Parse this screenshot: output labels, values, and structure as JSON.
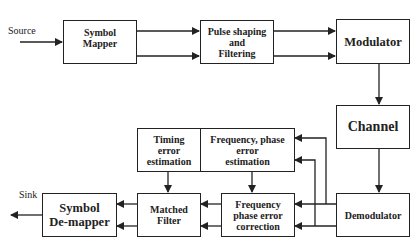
{
  "diagram": {
    "type": "communication-system-block-diagram",
    "labels": {
      "source": "Source",
      "sink": "Sink"
    },
    "blocks": {
      "symbol_mapper": "Symbol\nMapper",
      "pulse_shaping": "Pulse shaping\nand\nFiltering",
      "modulator": "Modulator",
      "channel": "Channel",
      "timing_error": "Timing\nerror\nestimation",
      "freq_phase_estimation": "Frequency, phase\nerror\nestimation",
      "symbol_demapper": "Symbol\nDe-mapper",
      "matched_filter": "Matched\nFilter",
      "freq_phase_correction": "Frequency\nphase error\ncorrection",
      "demodulator": "Demodulator"
    },
    "connections": [
      {
        "from": "Source",
        "to": "Symbol Mapper",
        "count": 1
      },
      {
        "from": "Symbol Mapper",
        "to": "Pulse shaping and Filtering",
        "count": 2
      },
      {
        "from": "Pulse shaping and Filtering",
        "to": "Modulator",
        "count": 2
      },
      {
        "from": "Modulator",
        "to": "Channel",
        "count": 1
      },
      {
        "from": "Channel",
        "to": "Demodulator",
        "count": 1
      },
      {
        "from": "Demodulator",
        "to": "Frequency phase error correction",
        "count": 2
      },
      {
        "from": "Demodulator",
        "to": "Frequency, phase error estimation",
        "count": 2
      },
      {
        "from": "Frequency, phase error estimation",
        "to": "Frequency phase error correction",
        "count": 1
      },
      {
        "from": "Timing error estimation",
        "to": "Matched Filter",
        "count": 1
      },
      {
        "from": "Frequency phase error correction",
        "to": "Matched Filter",
        "count": 2
      },
      {
        "from": "Matched Filter",
        "to": "Symbol De-mapper",
        "count": 2
      },
      {
        "from": "Symbol De-mapper",
        "to": "Sink",
        "count": 1
      }
    ],
    "colors": {
      "line": "#222222",
      "background": "#ffffff"
    }
  }
}
